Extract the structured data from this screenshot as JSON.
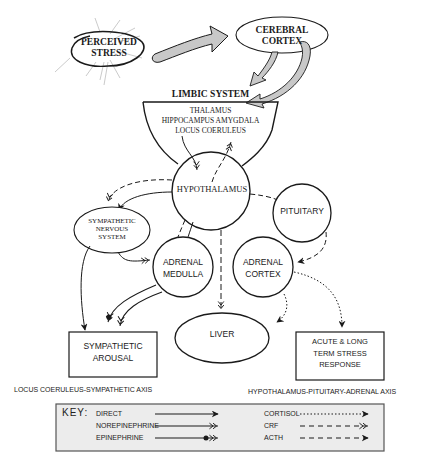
{
  "diagram": {
    "nodes": {
      "perceived_stress": {
        "line1": "PERCEIVED",
        "line2": "STRESS"
      },
      "cerebral_cortex": {
        "line1": "CEREBRAL",
        "line2": "CORTEX"
      },
      "limbic_system": {
        "title": "LIMBIC SYSTEM",
        "items": [
          "THALAMUS",
          "HIPPOCAMPUS AMYGDALA",
          "LOCUS COERULEUS"
        ]
      },
      "hypothalamus": {
        "label": "HYPOTHALAMUS"
      },
      "sympathetic_nervous_system": {
        "line1": "SYMPATHETIC",
        "line2": "NERVOUS",
        "line3": "SYSTEM"
      },
      "pituitary": {
        "label": "PITUITARY"
      },
      "adrenal_medulla": {
        "line1": "ADRENAL",
        "line2": "MEDULLA"
      },
      "adrenal_cortex": {
        "line1": "ADRENAL",
        "line2": "CORTEX"
      },
      "liver": {
        "label": "LIVER"
      },
      "sympathetic_arousal": {
        "line1": "SYMPATHETIC",
        "line2": "AROUSAL"
      },
      "stress_response": {
        "line1": "ACUTE & LONG",
        "line2": "TERM  STRESS",
        "line3": "RESPONSE"
      }
    },
    "axis_labels": {
      "left": "LOCUS COERULEUS-SYMPATHETIC AXIS",
      "right": "HYPOTHALAMUS-PITUITARY-ADRENAL AXIS"
    },
    "key": {
      "title": "KEY:",
      "left_items": [
        {
          "label": "DIRECT",
          "style": "solid-arrow"
        },
        {
          "label": "NOREPINEPHRINE",
          "style": "solid-double-chevron"
        },
        {
          "label": "EPINEPHRINE",
          "style": "solid-dot-double-chevron"
        }
      ],
      "right_items": [
        {
          "label": "CORTISOL",
          "style": "dotted-arrow"
        },
        {
          "label": "CRF",
          "style": "dashed-double-chevron"
        },
        {
          "label": "ACTH",
          "style": "dashed-arrow"
        }
      ]
    },
    "colors": {
      "line": "#1a1a1a",
      "big_arrow_fill": "#c8c8c8",
      "key_bg": "#ececec"
    }
  }
}
